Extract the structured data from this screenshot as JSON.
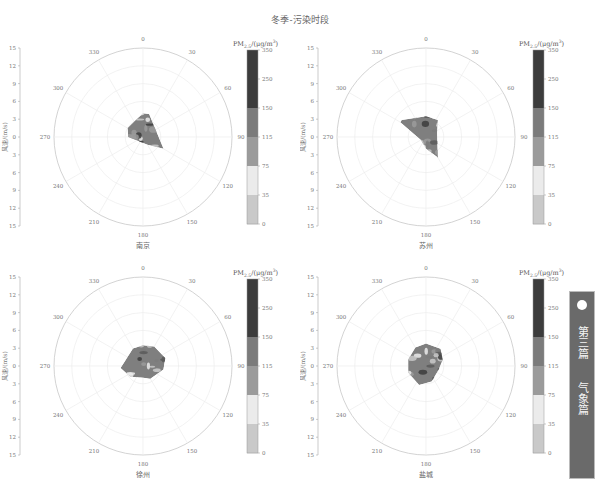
{
  "title": "冬季-污染时段",
  "side_tab": {
    "chapter": "第三篇",
    "section": "气象篇",
    "color": "#6a6a6a"
  },
  "colorbar": {
    "title": "PM2.5/(μg/m³)",
    "ticks": [
      "350",
      "250",
      "150",
      "115",
      "75",
      "35",
      "0"
    ],
    "bands": [
      {
        "from": 0,
        "to": 35,
        "color": "#c9c9c9"
      },
      {
        "from": 35,
        "to": 75,
        "color": "#ebebeb"
      },
      {
        "from": 75,
        "to": 115,
        "color": "#9b9b9b"
      },
      {
        "from": 115,
        "to": 150,
        "color": "#7b7b7b"
      },
      {
        "from": 150,
        "to": 350,
        "color": "#3c3c3c"
      }
    ]
  },
  "axis": {
    "ylabel": "风速/(m/s)",
    "yticks": [
      "15",
      "12",
      "9",
      "6",
      "3",
      "0",
      "3",
      "6",
      "9",
      "12",
      "15"
    ],
    "angle_ticks": [
      "0",
      "30",
      "60",
      "90",
      "120",
      "150",
      "180",
      "210",
      "240",
      "270",
      "300",
      "330"
    ]
  },
  "chart_data": [
    {
      "type": "heatmap",
      "subtype": "polar bivariate plot (wind direction × wind speed)",
      "title": "冬季-污染时段",
      "panel_label": "南京",
      "xlabel": "风向 (°)",
      "ylabel": "风速/(m/s)",
      "radial_range": [
        0,
        15
      ],
      "angle_ticks": [
        0,
        30,
        60,
        90,
        120,
        150,
        180,
        210,
        240,
        270,
        300,
        330
      ],
      "color_levels": [
        0,
        35,
        75,
        115,
        150,
        250,
        350
      ],
      "data_extent": "wind speed up to ~4 m/s; directions ~300°–120° via north, concentration mostly 75–150 with patches >150 near north",
      "wedge": [
        [
          -30,
          3
        ],
        [
          0,
          4
        ],
        [
          15,
          4
        ],
        [
          120,
          4
        ],
        [
          150,
          1.5
        ],
        [
          240,
          1.2
        ],
        [
          270,
          2.5
        ],
        [
          300,
          3
        ]
      ]
    },
    {
      "type": "heatmap",
      "subtype": "polar bivariate plot",
      "panel_label": "苏州",
      "radial_range": [
        0,
        15
      ],
      "color_levels": [
        0,
        35,
        75,
        115,
        150,
        250,
        350
      ],
      "data_extent": "wind speed up to ~5 m/s; directions ~300°–150°, mostly 75–150 with light patches",
      "wedge": [
        [
          -55,
          5
        ],
        [
          0,
          3.5
        ],
        [
          35,
          3.5
        ],
        [
          70,
          2
        ],
        [
          150,
          4
        ],
        [
          180,
          2
        ],
        [
          240,
          1
        ],
        [
          300,
          5
        ]
      ]
    },
    {
      "type": "heatmap",
      "subtype": "polar bivariate plot",
      "panel_label": "徐州",
      "radial_range": [
        0,
        15
      ],
      "color_levels": [
        0,
        35,
        75,
        115,
        150,
        250,
        350
      ],
      "data_extent": "wind speed up to ~4 m/s in all directions, mixed 75–250",
      "wedge": [
        [
          0,
          3.5
        ],
        [
          30,
          3.8
        ],
        [
          70,
          4
        ],
        [
          100,
          3.5
        ],
        [
          150,
          2.5
        ],
        [
          180,
          2
        ],
        [
          230,
          2.8
        ],
        [
          265,
          3.8
        ],
        [
          300,
          3
        ],
        [
          330,
          3.4
        ]
      ]
    },
    {
      "type": "heatmap",
      "subtype": "polar bivariate plot",
      "panel_label": "盐城",
      "radial_range": [
        0,
        15
      ],
      "color_levels": [
        0,
        35,
        75,
        115,
        150,
        250,
        350
      ],
      "data_extent": "wind speed up to ~4 m/s, mixed 35–150 with light patches",
      "wedge": [
        [
          0,
          3.8
        ],
        [
          40,
          3.8
        ],
        [
          70,
          3
        ],
        [
          110,
          2.2
        ],
        [
          160,
          2.8
        ],
        [
          200,
          3.4
        ],
        [
          250,
          3.2
        ],
        [
          290,
          3.2
        ],
        [
          330,
          3.6
        ]
      ]
    }
  ],
  "panels": [
    {
      "label": "南京"
    },
    {
      "label": "苏州"
    },
    {
      "label": "徐州"
    },
    {
      "label": "盐城"
    }
  ]
}
